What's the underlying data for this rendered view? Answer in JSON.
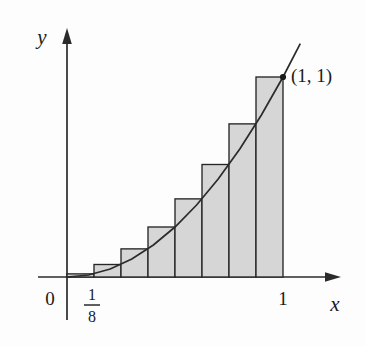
{
  "figure": {
    "axes": {
      "x_label": "x",
      "y_label": "y",
      "origin_label": "0"
    },
    "ticks": {
      "x": [
        {
          "label": "1/8",
          "numerator": "1",
          "denominator": "8",
          "value": 0.125,
          "is_fraction": true
        },
        {
          "label": "1",
          "value": 1,
          "is_fraction": false
        }
      ]
    },
    "annotations": [
      {
        "name": "endpoint-label",
        "text": "(1, 1)",
        "x": 1,
        "y": 1
      }
    ],
    "colors": {
      "bar_fill": "#d6d6d6",
      "bar_stroke": "#262626",
      "curve": "#2b2b2b",
      "axis": "#2b2b2b",
      "text": "#1a1a1a",
      "background": "#fdfdfd"
    }
  },
  "chart_data": {
    "type": "bar",
    "title": "",
    "subtitle": "",
    "xlabel": "x",
    "ylabel": "y",
    "xlim": [
      0,
      1.12
    ],
    "ylim": [
      0,
      1.16
    ],
    "grid": false,
    "legend": null,
    "function": "y = x^2",
    "method": "right endpoint rectangles",
    "n_rectangles": 8,
    "rectangle_width": 0.125,
    "categories": [
      "1/8",
      "2/8",
      "3/8",
      "4/8",
      "5/8",
      "6/8",
      "7/8",
      "1"
    ],
    "x_right_endpoints": [
      0.125,
      0.25,
      0.375,
      0.5,
      0.625,
      0.75,
      0.875,
      1
    ],
    "values": [
      0.015625,
      0.0625,
      0.140625,
      0.25,
      0.390625,
      0.5625,
      0.765625,
      1
    ],
    "curve": {
      "name": "y = x^2",
      "x": [
        0,
        0.1,
        0.2,
        0.3,
        0.4,
        0.5,
        0.6,
        0.7,
        0.8,
        0.9,
        1.0,
        1.08
      ],
      "y": [
        0,
        0.01,
        0.04,
        0.09,
        0.16,
        0.25,
        0.36,
        0.49,
        0.64,
        0.81,
        1.0,
        1.1664
      ]
    },
    "x_ticks": [
      {
        "value": 0,
        "label": "0"
      },
      {
        "value": 0.125,
        "label": "1/8"
      },
      {
        "value": 1,
        "label": "1"
      }
    ],
    "annotations": [
      {
        "text": "(1, 1)",
        "x": 1,
        "y": 1
      }
    ]
  }
}
